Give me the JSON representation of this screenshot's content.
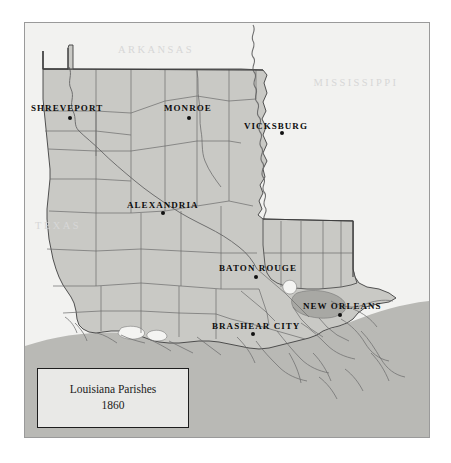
{
  "map": {
    "title": "Louisiana Parishes 1860",
    "legend": {
      "line1": "Louisiana Parishes",
      "line2": "1860"
    },
    "colors": {
      "page_background": "#ffffff",
      "map_background": "#f2f2f0",
      "land_fill": "#c9c9c5",
      "gulf_fill": "#b9b9b5",
      "lake_fill": "#a8a8a4",
      "water_light": "#f4f4f2",
      "boundary_line": "#6b6b6b",
      "state_outline": "#3f3f3f",
      "river_line": "#6f6f6f",
      "city_label": "#0d0d0d",
      "state_label": "#d7d7d7",
      "frame_border": "#9a9a9a",
      "legend_border": "#1d1d1d"
    },
    "state_labels": [
      {
        "name": "arkansas",
        "text": "ARKANSAS",
        "x": 155,
        "y": 52
      },
      {
        "name": "mississippi",
        "text": "MISSISSIPPI",
        "x": 355,
        "y": 85
      },
      {
        "name": "texas",
        "text": "TEXAS",
        "x": 57,
        "y": 228
      }
    ],
    "city_labels": [
      {
        "name": "shreveport",
        "text": "SHREVEPORT",
        "label_x": 30,
        "label_y": 110,
        "dot_x": 69,
        "dot_y": 117,
        "anchor": "start"
      },
      {
        "name": "monroe",
        "text": "MONROE",
        "label_x": 163,
        "label_y": 110,
        "dot_x": 188,
        "dot_y": 117,
        "anchor": "start"
      },
      {
        "name": "vicksburg",
        "text": "VICKSBURG",
        "label_x": 243,
        "label_y": 128,
        "dot_x": 281,
        "dot_y": 132,
        "anchor": "start"
      },
      {
        "name": "alexandria",
        "text": "ALEXANDRIA",
        "label_x": 126,
        "label_y": 207,
        "dot_x": 162,
        "dot_y": 212,
        "anchor": "start"
      },
      {
        "name": "baton-rouge",
        "text": "BATON ROUGE",
        "label_x": 218,
        "label_y": 270,
        "dot_x": 255,
        "dot_y": 276,
        "anchor": "start"
      },
      {
        "name": "new-orleans",
        "text": "NEW ORLEANS",
        "label_x": 302,
        "label_y": 308,
        "dot_x": 339,
        "dot_y": 314,
        "anchor": "start"
      },
      {
        "name": "brashear-city",
        "text": "BRASHEAR CITY",
        "label_x": 211,
        "label_y": 328,
        "dot_x": 252,
        "dot_y": 333,
        "anchor": "start"
      }
    ]
  }
}
